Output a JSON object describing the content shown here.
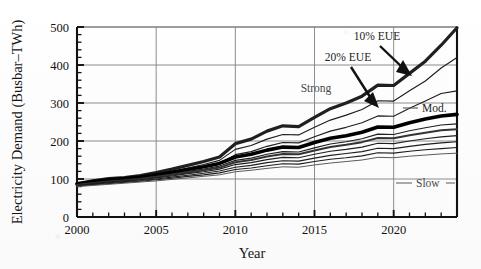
{
  "chart_data": {
    "type": "line",
    "title": "",
    "xlabel": "Year",
    "ylabel": "Electricity Demand (Busbar–TWh)",
    "xlim": [
      2000,
      2024
    ],
    "ylim": [
      0,
      500
    ],
    "ytick_values": [
      0,
      100,
      200,
      300,
      400,
      500
    ],
    "ytick_labels": [
      "0",
      "100",
      "200",
      "300",
      "400",
      "500"
    ],
    "xtick_values": [
      2000,
      2005,
      2010,
      2015,
      2020
    ],
    "xtick_labels": [
      "2000",
      "2005",
      "2010",
      "2015",
      "2020"
    ],
    "minor_ticks": "every 1 year on x, every 20 TWh on y",
    "grid": "horizontal at 100,200,300,400,500; vertical at 2005,2010,2015,2020",
    "legend": "none (inline annotations with arrows and leader lines)",
    "legend_position": "inline",
    "x": [
      2000,
      2001,
      2002,
      2003,
      2004,
      2005,
      2006,
      2007,
      2008,
      2009,
      2010,
      2011,
      2012,
      2013,
      2014,
      2015,
      2016,
      2017,
      2018,
      2019,
      2020,
      2021,
      2022,
      2023,
      2024
    ],
    "series": [
      {
        "name": "Strong growth, 10% EUE",
        "style": "thick",
        "values": [
          88,
          95,
          101,
          104,
          109,
          117,
          126,
          136,
          146,
          158,
          193,
          205,
          226,
          240,
          238,
          262,
          285,
          300,
          318,
          347,
          346,
          378,
          410,
          452,
          498
        ]
      },
      {
        "name": "Strong growth, 20% EUE",
        "style": "thin",
        "values": [
          86,
          92,
          97,
          100,
          105,
          112,
          120,
          129,
          138,
          149,
          178,
          188,
          205,
          217,
          216,
          236,
          255,
          268,
          283,
          306,
          305,
          332,
          358,
          392,
          420
        ]
      },
      {
        "name": "Strong growth, low reserve",
        "style": "thin",
        "values": [
          85,
          90,
          95,
          98,
          102,
          108,
          115,
          123,
          131,
          141,
          164,
          172,
          186,
          196,
          195,
          211,
          226,
          236,
          248,
          266,
          265,
          286,
          305,
          325,
          332
        ]
      },
      {
        "name": "Moderate growth, 10% EUE",
        "style": "thick-black",
        "values": [
          87,
          93,
          98,
          101,
          105,
          111,
          118,
          125,
          132,
          141,
          158,
          165,
          176,
          184,
          183,
          196,
          207,
          214,
          223,
          237,
          236,
          248,
          258,
          266,
          270
        ]
      },
      {
        "name": "Moderate growth, 20% EUE",
        "style": "thin",
        "values": [
          85,
          90,
          95,
          98,
          102,
          107,
          113,
          120,
          126,
          134,
          149,
          155,
          165,
          172,
          171,
          182,
          192,
          198,
          206,
          218,
          217,
          227,
          235,
          242,
          245
        ]
      },
      {
        "name": "Moderate growth, variant C",
        "style": "medium",
        "values": [
          84,
          89,
          93,
          96,
          100,
          105,
          111,
          117,
          123,
          130,
          144,
          150,
          159,
          166,
          165,
          175,
          184,
          190,
          197,
          208,
          207,
          215,
          222,
          228,
          231
        ]
      },
      {
        "name": "Moderate growth, variant D",
        "style": "thin",
        "values": [
          83,
          88,
          92,
          95,
          98,
          103,
          108,
          114,
          119,
          126,
          138,
          143,
          151,
          157,
          156,
          165,
          173,
          178,
          184,
          194,
          193,
          200,
          206,
          211,
          214
        ]
      },
      {
        "name": "Slow growth, 10% EUE",
        "style": "thin",
        "values": [
          82,
          86,
          90,
          93,
          96,
          100,
          105,
          110,
          115,
          121,
          131,
          136,
          143,
          148,
          147,
          155,
          162,
          167,
          172,
          181,
          180,
          186,
          191,
          195,
          198
        ]
      },
      {
        "name": "Slow growth, 20% EUE",
        "style": "thin",
        "values": [
          81,
          85,
          88,
          91,
          94,
          98,
          102,
          107,
          111,
          116,
          125,
          129,
          135,
          140,
          139,
          146,
          152,
          156,
          161,
          169,
          168,
          173,
          177,
          180,
          183
        ]
      },
      {
        "name": "Slow growth, low reserve",
        "style": "thin-gray",
        "values": [
          80,
          83,
          86,
          89,
          92,
          95,
          99,
          103,
          107,
          111,
          119,
          123,
          128,
          132,
          131,
          137,
          142,
          146,
          150,
          157,
          156,
          160,
          163,
          166,
          168
        ]
      }
    ],
    "annotations": [
      {
        "text": "10% EUE",
        "kind": "arrow-label",
        "points_to_series": "Strong growth, 10% EUE",
        "x": 2019,
        "y": 345
      },
      {
        "text": "20% EUE",
        "kind": "arrow-label",
        "points_to_series": "Strong growth, 20% EUE",
        "x": 2019,
        "y": 305
      },
      {
        "text": "Strong",
        "kind": "group-label",
        "x": 2013,
        "y": 300
      },
      {
        "text": "Mod.",
        "kind": "leader-label",
        "x": 2022,
        "y": 255
      },
      {
        "text": "Slow",
        "kind": "leader-label",
        "x": 2022,
        "y": 120
      }
    ],
    "colors": {
      "axis": "#111111",
      "grid": "#808080",
      "line_dark": "#1a1a1a",
      "line_gray": "#555555",
      "background": "#ffffff"
    }
  }
}
